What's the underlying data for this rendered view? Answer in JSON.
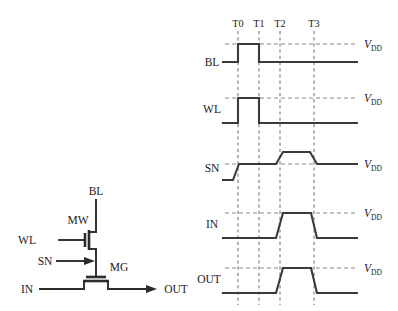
{
  "figure": {
    "kind": "circuit-and-timing-diagram",
    "background": "#ffffff",
    "line_color": "#2b2b2b",
    "dash_color": "#8a8a8a"
  },
  "circuit": {
    "labels": {
      "bl": "BL",
      "wl": "WL",
      "sn": "SN",
      "in": "IN",
      "out": "OUT",
      "mw": "MW",
      "mg": "MG"
    },
    "nodes": [
      {
        "name": "BL",
        "role": "bit-line-terminal"
      },
      {
        "name": "WL",
        "role": "word-line-input"
      },
      {
        "name": "SN",
        "role": "storage-node-pointer"
      },
      {
        "name": "IN",
        "role": "input-terminal"
      },
      {
        "name": "OUT",
        "role": "output-terminal"
      }
    ],
    "transistors": [
      {
        "name": "MW",
        "type": "nmos",
        "role": "write-transistor"
      },
      {
        "name": "MG",
        "type": "nmos",
        "role": "gating-transistor"
      }
    ]
  },
  "timing": {
    "time_marks": [
      "T0",
      "T1",
      "T2",
      "T3"
    ],
    "vdd_label_v": "V",
    "vdd_label_sub": "DD",
    "signals": [
      {
        "name": "BL",
        "label": "BL",
        "vdd_label_v": "V",
        "vdd_label_sub": "DD",
        "description": "pulse high from T0 to T1, sharp edges",
        "levels": [
          0,
          1,
          1,
          0,
          0,
          0,
          0
        ]
      },
      {
        "name": "WL",
        "label": "WL",
        "vdd_label_v": "V",
        "vdd_label_sub": "DD",
        "description": "pulse high from T0 to T1, sharp edges",
        "levels": [
          0,
          1,
          1,
          0,
          0,
          0,
          0
        ]
      },
      {
        "name": "SN",
        "label": "SN",
        "vdd_label_v": "V",
        "vdd_label_sub": "DD",
        "description": "rises to VDD just before T0, boosted above VDD between T2 and T3, returns to VDD after T3",
        "levels": [
          0,
          1,
          1,
          1.38,
          1.38,
          1,
          1
        ]
      },
      {
        "name": "IN",
        "label": "IN",
        "vdd_label_v": "V",
        "vdd_label_sub": "DD",
        "description": "pulse high from T2 to T3 with slanted edges",
        "levels": [
          0,
          0,
          0,
          1,
          1,
          0,
          0
        ]
      },
      {
        "name": "OUT",
        "label": "OUT",
        "vdd_label_v": "V",
        "vdd_label_sub": "DD",
        "description": "pulse high from T2 to T3 with slanted edges, follows IN",
        "levels": [
          0,
          0,
          0,
          1,
          1,
          0,
          0
        ]
      }
    ]
  }
}
